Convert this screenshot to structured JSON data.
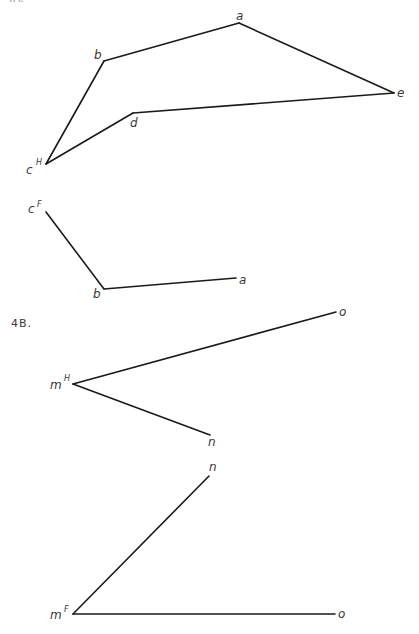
{
  "problems": [
    {
      "id": "4A",
      "label": "4A.",
      "views": [
        {
          "name": "top-view",
          "plane": "H",
          "vertices": [
            {
              "name": "a",
              "x": 239,
              "y": 23,
              "lx": 236,
              "ly": 20
            },
            {
              "name": "b",
              "x": 104,
              "y": 61,
              "lx": 94,
              "ly": 59
            },
            {
              "name": "c",
              "x": 46,
              "y": 164,
              "lx": 26,
              "ly": 174,
              "sup": "H",
              "sx": 36,
              "sy": 165
            },
            {
              "name": "d",
              "x": 133,
              "y": 113,
              "lx": 130,
              "ly": 127
            },
            {
              "name": "e",
              "x": 394,
              "y": 93,
              "lx": 397,
              "ly": 97
            }
          ],
          "edges": [
            [
              "c",
              "b"
            ],
            [
              "b",
              "a"
            ],
            [
              "a",
              "e"
            ],
            [
              "e",
              "d"
            ],
            [
              "d",
              "c"
            ]
          ]
        },
        {
          "name": "front-view",
          "plane": "F",
          "vertices": [
            {
              "name": "c",
              "x": 46,
              "y": 212,
              "lx": 28,
              "ly": 213,
              "sup": "F",
              "sx": 37,
              "sy": 207
            },
            {
              "name": "b",
              "x": 104,
              "y": 289,
              "lx": 93,
              "ly": 298
            },
            {
              "name": "a",
              "x": 236,
              "y": 278,
              "lx": 239,
              "ly": 284
            }
          ],
          "edges": [
            [
              "c",
              "b"
            ],
            [
              "b",
              "a"
            ]
          ]
        }
      ]
    },
    {
      "id": "4B",
      "label": "4B.",
      "label_pos": {
        "x": 11,
        "y": 327
      },
      "views": [
        {
          "name": "top-view",
          "plane": "H",
          "vertices": [
            {
              "name": "m",
              "x": 73,
              "y": 384,
              "lx": 50,
              "ly": 389,
              "sup": "H",
              "sx": 64,
              "sy": 381
            },
            {
              "name": "n",
              "x": 210,
              "y": 435,
              "lx": 208,
              "ly": 446
            },
            {
              "name": "o",
              "x": 336,
              "y": 312,
              "lx": 339,
              "ly": 316
            }
          ],
          "edges": [
            [
              "m",
              "o"
            ],
            [
              "m",
              "n"
            ]
          ]
        },
        {
          "name": "front-view",
          "plane": "F",
          "vertices": [
            {
              "name": "m",
              "x": 73,
              "y": 614,
              "lx": 50,
              "ly": 619,
              "sup": "F",
              "sx": 64,
              "sy": 612
            },
            {
              "name": "n",
              "x": 209,
              "y": 476,
              "lx": 209,
              "ly": 471
            },
            {
              "name": "o",
              "x": 335,
              "y": 614,
              "lx": 338,
              "ly": 618
            }
          ],
          "edges": [
            [
              "m",
              "n"
            ],
            [
              "m",
              "o"
            ]
          ]
        }
      ]
    }
  ],
  "header_cut_text": "4A."
}
